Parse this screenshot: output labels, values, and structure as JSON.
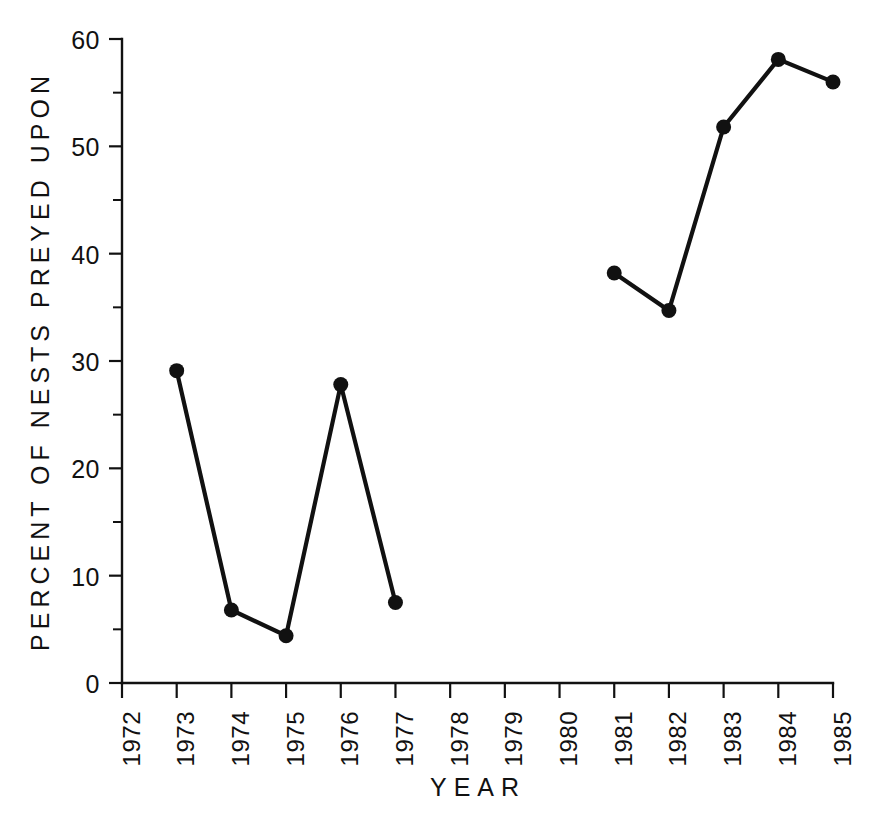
{
  "chart_data": {
    "type": "line",
    "title": "",
    "subtitle": "",
    "xlabel": "YEAR",
    "ylabel": "PERCENT OF NESTS PREYED UPON",
    "xlim": [
      1972,
      1985
    ],
    "ylim": [
      0,
      60
    ],
    "grid": false,
    "legend": null,
    "x_tick_labels": [
      "1972",
      "1973",
      "1974",
      "1975",
      "1976",
      "1977",
      "1978",
      "1979",
      "1980",
      "1981",
      "1982",
      "1983",
      "1984",
      "1985"
    ],
    "x_ticks": [
      1972,
      1973,
      1974,
      1975,
      1976,
      1977,
      1978,
      1979,
      1980,
      1981,
      1982,
      1983,
      1984,
      1985
    ],
    "y_tick_labels": [
      "0",
      "10",
      "20",
      "30",
      "40",
      "50",
      "60"
    ],
    "y_ticks": [
      0,
      10,
      20,
      30,
      40,
      50,
      60
    ],
    "y_minor_ticks": [
      5,
      15,
      25,
      35,
      45,
      55
    ],
    "marker": "filled-circle",
    "line_color": "#111111",
    "marker_color": "#111111",
    "series": [
      {
        "name": "Percent of nests preyed upon",
        "segments": [
          {
            "x": [
              1973,
              1974,
              1975,
              1976,
              1977
            ],
            "y": [
              29.1,
              6.8,
              4.4,
              27.8,
              7.5
            ]
          },
          {
            "x": [
              1981,
              1982,
              1983,
              1984,
              1985
            ],
            "y": [
              38.2,
              34.7,
              51.8,
              58.1,
              56.0
            ]
          }
        ]
      }
    ],
    "missing_years": [
      1972,
      1978,
      1979,
      1980
    ],
    "axis_style": {
      "spines": [
        "left",
        "bottom"
      ],
      "tick_direction": "out",
      "background": "#ffffff",
      "foreground": "#111111"
    },
    "geometry": {
      "x_left_px": 122,
      "x_right_px": 833,
      "y_zero_px": 683,
      "y_top_px": 39,
      "marker_radius_px": 7.5
    }
  }
}
